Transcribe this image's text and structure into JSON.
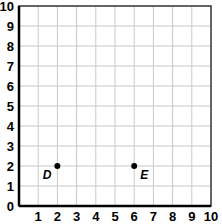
{
  "chart_data": {
    "type": "scatter",
    "title": "",
    "xlabel": "",
    "ylabel": "",
    "xlim": [
      0,
      10
    ],
    "ylim": [
      0,
      10
    ],
    "grid": true,
    "x_ticks": [
      "1",
      "2",
      "3",
      "4",
      "5",
      "6",
      "7",
      "8",
      "9",
      "10"
    ],
    "y_ticks": [
      "0",
      "1",
      "2",
      "3",
      "4",
      "5",
      "6",
      "7",
      "8",
      "9",
      "10"
    ],
    "points": [
      {
        "label": "D",
        "x": 2,
        "y": 2
      },
      {
        "label": "E",
        "x": 6,
        "y": 2
      }
    ]
  },
  "colors": {
    "grid": "#c8c8c8",
    "axis": "#000000",
    "border": "#333333",
    "point": "#000000"
  }
}
